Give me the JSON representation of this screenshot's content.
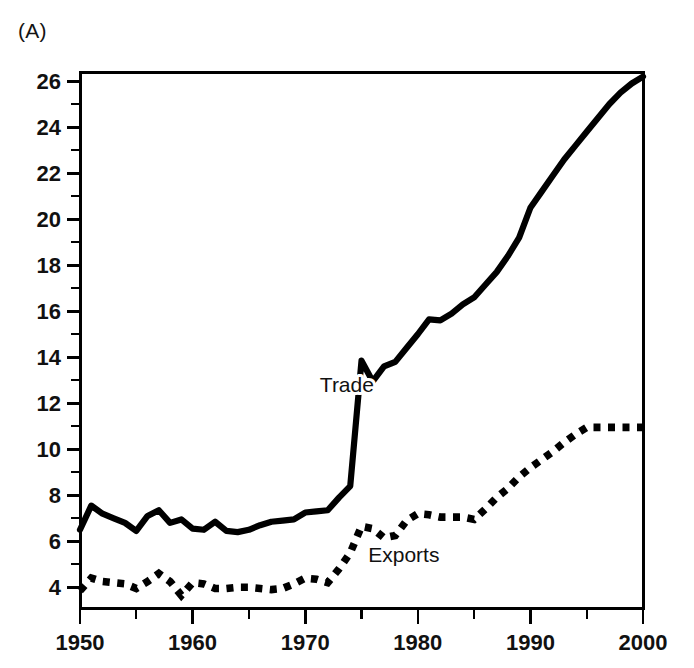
{
  "figure": {
    "panel_label": "(A)",
    "background_color": "#ffffff",
    "ink_color": "#000000"
  },
  "chart_data": {
    "type": "line",
    "title": "(A)",
    "xlabel": "",
    "ylabel": "",
    "xlim": [
      1950,
      2000
    ],
    "ylim": [
      3.1,
      26.4
    ],
    "grid": false,
    "legend": "inline-annotations",
    "x_ticks_major": [
      1950,
      1960,
      1970,
      1980,
      1990,
      2000
    ],
    "x_ticks_minor": [
      1955,
      1965,
      1975,
      1985,
      1995
    ],
    "y_ticks_major": [
      4,
      6,
      8,
      10,
      12,
      14,
      16,
      18,
      20,
      22,
      24,
      26
    ],
    "y_ticks_minor": [
      5,
      7,
      9,
      11,
      13,
      15,
      17,
      19,
      21,
      23,
      25
    ],
    "x_tick_labels": [
      "1950",
      "1960",
      "1970",
      "1980",
      "1990",
      "2000"
    ],
    "y_tick_labels": [
      "4",
      "6",
      "8",
      "10",
      "12",
      "14",
      "16",
      "18",
      "20",
      "22",
      "24",
      "26"
    ],
    "x": [
      1950,
      1951,
      1952,
      1953,
      1954,
      1955,
      1956,
      1957,
      1958,
      1959,
      1960,
      1961,
      1962,
      1963,
      1964,
      1965,
      1966,
      1967,
      1968,
      1969,
      1970,
      1971,
      1972,
      1973,
      1974,
      1975,
      1976,
      1977,
      1978,
      1979,
      1980,
      1981,
      1982,
      1983,
      1984,
      1985,
      1986,
      1987,
      1988,
      1989,
      1990,
      1991,
      1992,
      1993,
      1994,
      1995,
      1996,
      1997,
      1998,
      1999,
      2000
    ],
    "series": [
      {
        "name": "Trade",
        "style": "solid",
        "label_text": "Trade",
        "values": [
          6.5,
          7.55,
          7.2,
          7.0,
          6.8,
          6.45,
          7.1,
          7.35,
          6.8,
          6.95,
          6.55,
          6.5,
          6.85,
          6.45,
          6.4,
          6.5,
          6.7,
          6.85,
          6.9,
          6.95,
          7.25,
          7.3,
          7.35,
          7.9,
          8.4,
          13.85,
          12.95,
          13.6,
          13.8,
          14.4,
          15.0,
          15.65,
          15.6,
          15.9,
          16.3,
          16.6,
          17.15,
          17.7,
          18.4,
          19.2,
          20.5,
          21.2,
          21.9,
          22.6,
          23.2,
          23.8,
          24.4,
          25.0,
          25.5,
          25.9,
          26.2
        ]
      },
      {
        "name": "Exports",
        "style": "dotted",
        "label_text": "Exports",
        "values": [
          3.85,
          4.4,
          4.25,
          4.2,
          4.15,
          3.95,
          4.25,
          4.6,
          4.25,
          3.65,
          4.2,
          4.15,
          3.95,
          3.95,
          4.0,
          4.0,
          3.95,
          3.9,
          3.95,
          4.15,
          4.4,
          4.35,
          4.2,
          4.8,
          5.5,
          6.65,
          6.55,
          6.15,
          6.25,
          6.9,
          7.2,
          7.15,
          7.05,
          7.05,
          7.05,
          6.95,
          7.4,
          7.9,
          8.3,
          8.8,
          9.2,
          9.55,
          9.9,
          10.3,
          10.65,
          10.95,
          10.95,
          10.95,
          10.95,
          10.95,
          10.95
        ]
      }
    ],
    "annotations": [
      {
        "text": "Trade",
        "x": 1971.3,
        "y": 12.5
      },
      {
        "text": "Exports",
        "x": 1975.6,
        "y": 5.1
      }
    ]
  }
}
